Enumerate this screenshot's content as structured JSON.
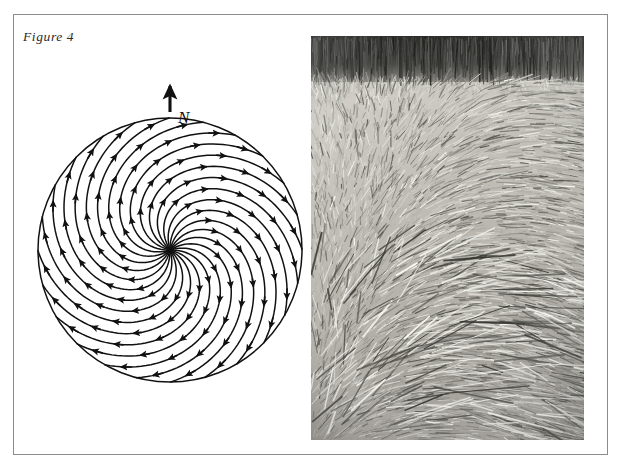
{
  "page": {
    "width": 623,
    "height": 474,
    "background_color": "#ffffff",
    "frame_border_color": "#8c8c8c"
  },
  "figure": {
    "label": "Figure 4",
    "label_style": "italic-serif"
  },
  "diagram": {
    "name": "crop-circle-lay-spiral-diagram",
    "type": "vector-field-spiral",
    "compass_label": "N",
    "compass_direction": "up",
    "compass_arrow_icon": "north-arrow-icon",
    "rotation_sense": "clockwise",
    "center": {
      "x": 152,
      "y": 200
    },
    "radius": 132,
    "arm_count": 24,
    "arrowheads_per_arm": 5,
    "stroke_color": "#111111",
    "fill_color": "#ffffff"
  },
  "photograph": {
    "name": "crop-circle-photograph",
    "caption": "",
    "palette": "black-and-white",
    "standing_crop_band_color": "#3a3a38",
    "flattened_crop_color": "#c9c7c0",
    "description": "Black and white photograph of a crop formation: a dark band of standing crop across the top, with swirled flattened straw filling the rest of the frame."
  }
}
